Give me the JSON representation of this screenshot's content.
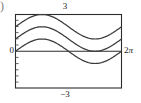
{
  "figure": {
    "kind": "direction-field-solution-curves",
    "corner_glyph": ")",
    "labels": {
      "top": "3",
      "bottom": "−3",
      "left": "0",
      "right_number": "2",
      "right_symbol": "π"
    },
    "colors": {
      "frame": "#2b2b2b",
      "axis": "#2b2b2b",
      "curve": "#3a3a3a",
      "tick": "#555555",
      "background": "#ffffff",
      "text": "#1a1a1a",
      "corner_glyph": "#7a7a7a"
    }
  },
  "chart_data": {
    "type": "line",
    "title": "",
    "xlabel": "",
    "ylabel": "",
    "xlim": [
      0,
      6.283185307179586
    ],
    "ylim": [
      -3,
      3
    ],
    "grid": false,
    "legend": "none",
    "xtick_labels": [
      "0",
      "2π"
    ],
    "ytick_labels": [
      "3",
      "−3"
    ],
    "annotations": [
      "3",
      "−3",
      "0",
      "2π"
    ],
    "x": [
      0,
      0.3141592653589793,
      0.6283185307179586,
      0.9424777960769379,
      1.2566370614359172,
      1.5707963267948966,
      1.8849555921538759,
      2.199114857512855,
      2.5132741228718345,
      2.827433388230814,
      3.141592653589793,
      3.455751918948773,
      3.7699111843077517,
      4.084070449666731,
      4.39822971502571,
      4.71238898038469,
      5.026548245743669,
      5.340707511102648,
      5.654866776461628,
      5.969026041820607,
      6.283185307179586
    ],
    "series": [
      {
        "name": "y = sin(x) + 2",
        "offset": 2,
        "amplitude": 1,
        "values": [
          2,
          2.309,
          2.588,
          2.809,
          2.951,
          3,
          2.951,
          2.809,
          2.588,
          2.309,
          2,
          1.691,
          1.412,
          1.191,
          1.049,
          1,
          1.049,
          1.191,
          1.412,
          1.691,
          2
        ]
      },
      {
        "name": "y = sin(x) + 1",
        "offset": 1,
        "amplitude": 1,
        "values": [
          1,
          1.309,
          1.588,
          1.809,
          1.951,
          2,
          1.951,
          1.809,
          1.588,
          1.309,
          1,
          0.691,
          0.412,
          0.191,
          0.049,
          0,
          0.049,
          0.191,
          0.412,
          0.691,
          1
        ]
      },
      {
        "name": "y = sin(x)",
        "offset": 0,
        "amplitude": 1,
        "values": [
          0,
          0.309,
          0.588,
          0.809,
          0.951,
          1,
          0.951,
          0.809,
          0.588,
          0.309,
          0,
          -0.309,
          -0.588,
          -0.809,
          -0.951,
          -1,
          -0.951,
          -0.809,
          -0.588,
          -0.309,
          0
        ]
      }
    ]
  }
}
